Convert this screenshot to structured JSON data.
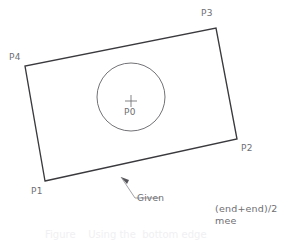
{
  "figure": {
    "kind": "technical-drawing",
    "colors": {
      "background": "#ffffff",
      "outline": "#3a3a3e",
      "circle": "#58585d",
      "label_text": "#6e6e72",
      "leader": "#8a8a90",
      "caption_text": "#f0f0f2"
    },
    "line_widths": {
      "rectangle": 1.35,
      "circle": 0.85,
      "leader": 0.8,
      "crosshair": 0.8
    }
  },
  "geometry": {
    "rectangle": {
      "label": "rectangle-outline",
      "corners": [
        {
          "name": "P1",
          "x": 45,
          "y": 181
        },
        {
          "name": "P2",
          "x": 237,
          "y": 139
        },
        {
          "name": "P3",
          "x": 216,
          "y": 28
        },
        {
          "name": "P4",
          "x": 25,
          "y": 66
        }
      ],
      "points_string": "45,181 237,139 216,28 25,66"
    },
    "circle": {
      "label": "inscribed-circle",
      "cx": 131,
      "cy": 97,
      "r": 34
    },
    "center_marker": {
      "label": "center-crosshair",
      "cx": 131,
      "cy": 101,
      "arm": 6
    },
    "leader": {
      "label": "given-leader-line",
      "points_string": "121,177 135,198 160,198",
      "arrow_tip": {
        "x": 121,
        "y": 177
      },
      "arrow_polygon": "121,177 129,180 127,184"
    }
  },
  "labels": {
    "p4": "P4",
    "p3": "P3",
    "p2": "P2",
    "p1": "P1",
    "p0": "P0",
    "given": "Given"
  },
  "notes": {
    "line1": "(end+end)/2",
    "line2": "mee"
  },
  "caption": {
    "text": "Figure    Using the  bottom edge"
  }
}
